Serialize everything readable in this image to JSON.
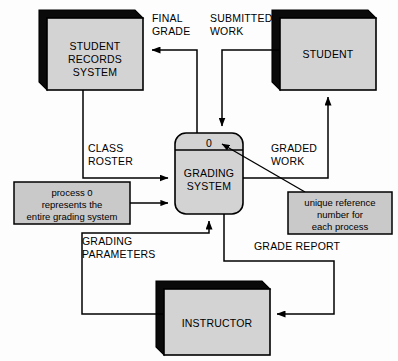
{
  "diagram": {
    "type": "context-data-flow-diagram",
    "colors": {
      "entity_fill": "#d3d3d3",
      "entity_shadow": "#0a0a0a",
      "process_fill": "#d3d3d3",
      "note_fill": "#c9c9c9",
      "stroke": "#000000",
      "background": "#fdfdfd"
    },
    "external_entities": [
      {
        "id": "student-records-system",
        "lines": [
          "STUDENT",
          "RECORDS",
          "SYSTEM"
        ],
        "line1": "STUDENT",
        "line2": "RECORDS",
        "line3": "SYSTEM"
      },
      {
        "id": "student",
        "lines": [
          "STUDENT"
        ],
        "line1": "STUDENT"
      },
      {
        "id": "instructor",
        "lines": [
          "INSTRUCTOR"
        ],
        "line1": "INSTRUCTOR"
      }
    ],
    "process": {
      "id": "grading-system",
      "number": "0",
      "line1": "GRADING",
      "line2": "SYSTEM"
    },
    "data_flows": [
      {
        "id": "final-grade",
        "line1": "FINAL",
        "line2": "GRADE",
        "from": "grading-system",
        "to": "student-records-system"
      },
      {
        "id": "submitted-work",
        "line1": "SUBMITTED",
        "line2": "WORK",
        "from": "student",
        "to": "grading-system"
      },
      {
        "id": "class-roster",
        "line1": "CLASS",
        "line2": "ROSTER",
        "from": "student-records-system",
        "to": "grading-system"
      },
      {
        "id": "graded-work",
        "line1": "GRADED",
        "line2": "WORK",
        "from": "grading-system",
        "to": "student"
      },
      {
        "id": "grading-parameters",
        "line1": "GRADING",
        "line2": "PARAMETERS",
        "from": "instructor",
        "to": "grading-system"
      },
      {
        "id": "grade-report",
        "line1": "GRADE REPORT",
        "from": "grading-system",
        "to": "instructor"
      }
    ],
    "annotations": [
      {
        "id": "process-zero-note",
        "line1": "process 0",
        "line2": "represents the",
        "line3": "entire grading system"
      },
      {
        "id": "unique-reference-note",
        "line1": "unique reference",
        "line2": "number for",
        "line3": "each process"
      }
    ]
  }
}
